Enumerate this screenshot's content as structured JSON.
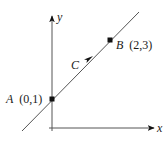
{
  "diagram": {
    "type": "coordinate-plane-line",
    "axes": {
      "x_label": "x",
      "y_label": "y",
      "origin_px": [
        52,
        128
      ]
    },
    "curve": {
      "label": "C",
      "direction": "from A toward B",
      "color": "#333333"
    },
    "points": [
      {
        "id": "A",
        "name": "A",
        "coords": "(0,1)",
        "px": [
          52,
          99
        ]
      },
      {
        "id": "B",
        "name": "B",
        "coords": "(2,3)",
        "px": [
          110,
          40
        ]
      }
    ]
  }
}
